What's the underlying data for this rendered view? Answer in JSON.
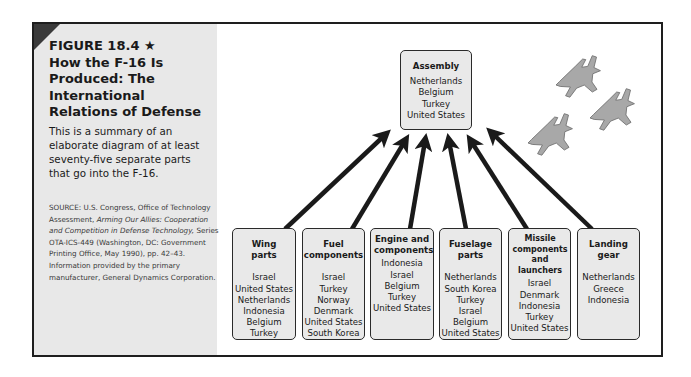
{
  "sidebar": {
    "title_line1": "FIGURE 18.4 ★",
    "title_rest": "How the F-16 Is Produced: The International Relations of Defense",
    "description": "This is a summary of an elaborate diagram of at least seventy-five separate parts that go into the F-16.",
    "source": {
      "prefix": "SOURCE: U.S. Congress, Office of Technology Assessment, ",
      "italic": "Arming Our Allies: Cooperation and Competition in Defense Technology,",
      "suffix": " Series OTA-ICS-449 (Washington, DC: Government Printing Office, May 1990), pp. 42–43. Information provided by the primary manufacturer, General Dynamics Corporation."
    }
  },
  "diagram": {
    "assembly": {
      "heading": "Assembly",
      "countries": [
        "Netherlands",
        "Belgium",
        "Turkey",
        "United States"
      ]
    },
    "parts": [
      {
        "heading": "Wing parts",
        "countries": [
          "Israel",
          "United States",
          "Netherlands",
          "Indonesia",
          "Belgium",
          "Turkey"
        ]
      },
      {
        "heading": "Fuel components",
        "countries": [
          "Israel",
          "Turkey",
          "Norway",
          "Denmark",
          "United States",
          "South Korea"
        ]
      },
      {
        "heading": "Engine and components",
        "countries": [
          "Indonesia",
          "Israel",
          "Belgium",
          "Turkey",
          "United States"
        ]
      },
      {
        "heading": "Fuselage parts",
        "countries": [
          "Netherlands",
          "South Korea",
          "Turkey",
          "Israel",
          "Belgium",
          "United States"
        ]
      },
      {
        "heading": "Missile components and launchers",
        "countries": [
          "Israel",
          "Denmark",
          "Indonesia",
          "Turkey",
          "United States"
        ]
      },
      {
        "heading": "Landing gear",
        "countries": [
          "Netherlands",
          "Greece",
          "Indonesia"
        ]
      }
    ],
    "decoration": "three-f16-jets-illustration"
  },
  "colors": {
    "border": "#1e1e1e",
    "sidebar_bg": "#e8e8e8",
    "box_bg": "#e9e9e9",
    "arrow": "#1a1a1a",
    "jet": "#a8a8a8"
  }
}
